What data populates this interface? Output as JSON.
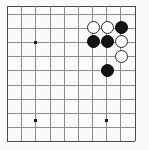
{
  "board": {
    "name": "go-board-diagram",
    "game": "Go",
    "visible_columns": 10,
    "visible_rows": 10,
    "line_color": "#8d8d8d",
    "edge_color": "#4a4a4a",
    "background_color": "#fdfdfd",
    "origin_x": 7,
    "origin_y": 6,
    "spacing_x": 14.2,
    "spacing_y": 14.2,
    "vertical_lines_x": [
      7,
      21,
      35,
      50,
      64,
      78,
      92,
      106,
      120,
      135
    ],
    "horizontal_lines_y": [
      6,
      14,
      28,
      42,
      56,
      70,
      85,
      99,
      113,
      127,
      141
    ],
    "star_points": [
      {
        "name": "star-point-left",
        "x": 35,
        "y": 42
      },
      {
        "name": "star-point-bottom-left",
        "x": 35,
        "y": 120
      },
      {
        "name": "star-point-bottom-right",
        "x": 106,
        "y": 120
      }
    ],
    "stones": [
      {
        "name": "stone-white-1",
        "color": "white",
        "x": 93,
        "y": 27
      },
      {
        "name": "stone-white-2",
        "color": "white",
        "x": 107,
        "y": 27
      },
      {
        "name": "stone-black-1",
        "color": "black",
        "x": 121,
        "y": 27
      },
      {
        "name": "stone-black-2",
        "color": "black",
        "x": 93,
        "y": 41
      },
      {
        "name": "stone-black-3",
        "color": "black",
        "x": 107,
        "y": 41
      },
      {
        "name": "stone-white-3",
        "color": "white",
        "x": 121,
        "y": 41
      },
      {
        "name": "stone-white-4",
        "color": "white",
        "x": 121,
        "y": 56
      },
      {
        "name": "stone-black-4",
        "color": "black",
        "x": 107,
        "y": 70
      }
    ],
    "stone_radius": 6.5,
    "black_stone_color": "#141414",
    "white_stone_color": "#ffffff",
    "white_stone_border": "#2a2a2a"
  }
}
